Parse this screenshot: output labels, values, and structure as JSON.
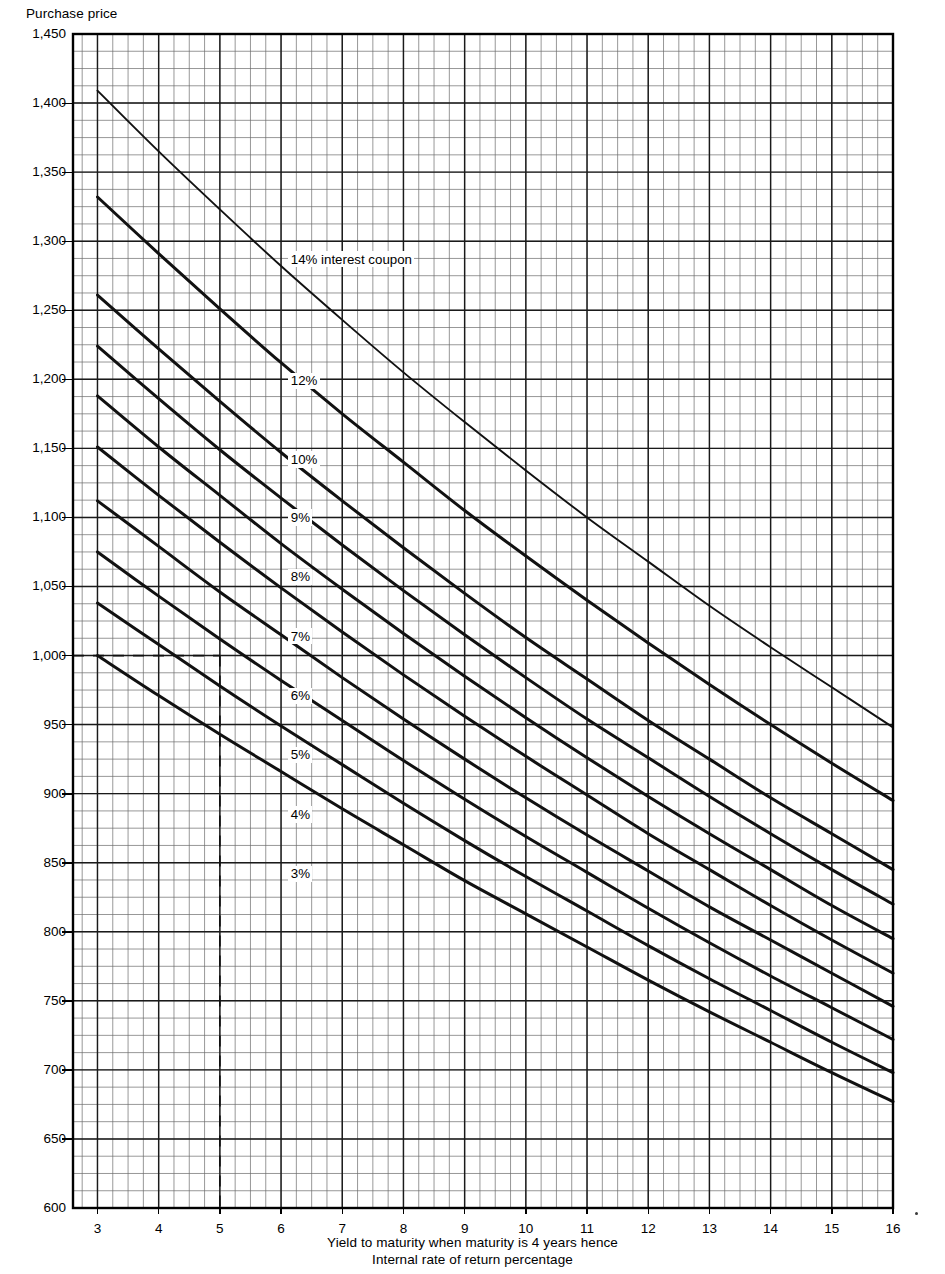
{
  "chart_data": {
    "type": "line",
    "title": "",
    "ylabel": "Purchase price",
    "xlabel": "Yield to maturity when maturity is 4 years hence",
    "xlabel2": "Internal rate of return percentage",
    "xlim": [
      2.6,
      16.0
    ],
    "ylim": [
      600,
      1450
    ],
    "xticks": [
      3,
      4,
      5,
      6,
      7,
      8,
      9,
      10,
      11,
      12,
      13,
      14,
      15,
      16
    ],
    "xtick_labels": [
      "3",
      "4",
      "5",
      "6",
      "7",
      "8",
      "9",
      "10",
      "11",
      "12",
      "13",
      "14",
      "15",
      "16"
    ],
    "yticks": [
      600,
      650,
      700,
      750,
      800,
      850,
      900,
      950,
      1000,
      1050,
      1100,
      1150,
      1200,
      1250,
      1300,
      1350,
      1400,
      1450
    ],
    "ytick_labels": [
      "600",
      "650",
      "700",
      "750",
      "800",
      "850",
      "900",
      "950",
      "1,000",
      "1,050",
      "1,100",
      "1,150",
      "1,200",
      "1,250",
      "1,300",
      "1,350",
      "1,400",
      "1,450"
    ],
    "grid": true,
    "grid_minor_x_step": 0.25,
    "grid_minor_y_step": 12.5,
    "legend": "inline-labels",
    "x": [
      3,
      4,
      5,
      6,
      7,
      8,
      9,
      10,
      11,
      12,
      13,
      14,
      15,
      16
    ],
    "series": [
      {
        "name": "14% interest coupon",
        "coupon": 14,
        "label": "14% interest coupon",
        "values": [
          1409,
          1365,
          1323,
          1282,
          1243,
          1205,
          1169,
          1134,
          1100,
          1068,
          1036,
          1006,
          977,
          948
        ]
      },
      {
        "name": "12%",
        "coupon": 12,
        "label": "12%",
        "values": [
          1332,
          1291,
          1251,
          1212,
          1175,
          1140,
          1105,
          1072,
          1040,
          1009,
          979,
          950,
          922,
          895
        ]
      },
      {
        "name": "10%",
        "coupon": 10,
        "label": "10%",
        "values": [
          1261,
          1222,
          1184,
          1147,
          1112,
          1078,
          1045,
          1013,
          983,
          953,
          925,
          897,
          871,
          845
        ]
      },
      {
        "name": "9%",
        "coupon": 9,
        "label": "9%",
        "values": [
          1224,
          1186,
          1149,
          1114,
          1080,
          1047,
          1015,
          984,
          954,
          926,
          898,
          871,
          845,
          820
        ]
      },
      {
        "name": "8%",
        "coupon": 8,
        "label": "8%",
        "values": [
          1188,
          1151,
          1116,
          1081,
          1048,
          1016,
          985,
          955,
          926,
          898,
          871,
          845,
          819,
          795
        ]
      },
      {
        "name": "7%",
        "coupon": 7,
        "label": "7%",
        "values": [
          1151,
          1116,
          1082,
          1049,
          1017,
          986,
          956,
          927,
          899,
          871,
          845,
          819,
          794,
          770
        ]
      },
      {
        "name": "6%",
        "coupon": 6,
        "label": "6%",
        "values": [
          1112,
          1079,
          1046,
          1015,
          984,
          954,
          925,
          897,
          870,
          844,
          818,
          794,
          770,
          746
        ]
      },
      {
        "name": "5%",
        "coupon": 5,
        "label": "5%",
        "values": [
          1075,
          1043,
          1012,
          982,
          953,
          924,
          896,
          869,
          843,
          817,
          792,
          768,
          745,
          722
        ]
      },
      {
        "name": "4%",
        "coupon": 4,
        "label": "4%",
        "values": [
          1038,
          1008,
          978,
          949,
          921,
          893,
          866,
          840,
          815,
          790,
          766,
          743,
          720,
          698
        ]
      },
      {
        "name": "3%",
        "coupon": 3,
        "label": "3%",
        "values": [
          1000,
          971,
          943,
          916,
          889,
          863,
          837,
          813,
          789,
          765,
          742,
          720,
          698,
          677
        ]
      }
    ],
    "annotations": [
      {
        "name": "reference-line-horizontal",
        "type": "dashed-h",
        "y": 1000,
        "x_from": 2.6,
        "x_to": 5
      },
      {
        "name": "reference-line-vertical",
        "type": "dashed-v",
        "x": 5,
        "y_from": 1000,
        "y_to": 600
      }
    ],
    "curve_label_positions": [
      {
        "series": "14% interest coupon",
        "x": 6.15,
        "y": 1287
      },
      {
        "series": "12%",
        "x": 6.15,
        "y": 1199
      },
      {
        "series": "10%",
        "x": 6.15,
        "y": 1142
      },
      {
        "series": "9%",
        "x": 6.15,
        "y": 1100
      },
      {
        "series": "8%",
        "x": 6.15,
        "y": 1057
      },
      {
        "series": "7%",
        "x": 6.15,
        "y": 1014
      },
      {
        "series": "6%",
        "x": 6.15,
        "y": 971
      },
      {
        "series": "5%",
        "x": 6.15,
        "y": 928
      },
      {
        "series": "4%",
        "x": 6.15,
        "y": 885
      },
      {
        "series": "3%",
        "x": 6.15,
        "y": 842
      }
    ]
  }
}
